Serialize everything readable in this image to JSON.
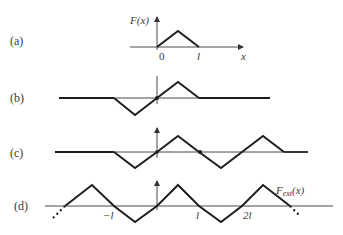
{
  "panels": [
    {
      "id": "a",
      "label": "(a)",
      "y_label": "F(x)",
      "x_ticks": [
        "0",
        "l"
      ],
      "x_axis_label": "x"
    },
    {
      "id": "b",
      "label": "(b)"
    },
    {
      "id": "c",
      "label": "(c)"
    },
    {
      "id": "d",
      "label": "(d)",
      "x_ticks": [
        "−l",
        "l",
        "2l"
      ],
      "curve_label_main": "F",
      "curve_label_sub": "ext",
      "curve_label_arg": "(x)"
    }
  ],
  "colors": {
    "line": "#1e1e1e",
    "axis": "#4a4a4a",
    "text": "#3a3a3a"
  }
}
